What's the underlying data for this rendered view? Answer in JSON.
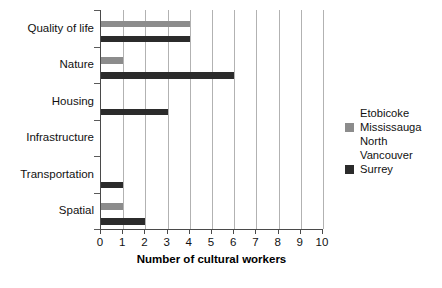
{
  "chart_data": {
    "type": "bar",
    "orientation": "horizontal",
    "title": "",
    "xlabel": "Number of cultural workers",
    "ylabel": "",
    "xlim": [
      0,
      10
    ],
    "xticks": [
      0,
      1,
      2,
      3,
      4,
      5,
      6,
      7,
      8,
      9,
      10
    ],
    "xtick_labels": [
      "0",
      "1",
      "2",
      "3",
      "4",
      "5",
      "6",
      "7",
      "8",
      "9",
      "10"
    ],
    "grid": "vertical",
    "legend_position": "right",
    "categories": [
      "Quality of life",
      "Nature",
      "Housing",
      "Infrastructure",
      "Transportation",
      "Spatial"
    ],
    "series": [
      {
        "name": "Etobicoke",
        "color": "#ffffff",
        "values": [
          0,
          0,
          0,
          0,
          0,
          0
        ]
      },
      {
        "name": "Mississauga",
        "color": "#8c8c8c",
        "values": [
          4,
          1,
          0,
          0,
          0,
          1
        ]
      },
      {
        "name": "North Vancouver",
        "color": "#ffffff",
        "values": [
          0,
          0,
          0,
          0,
          0,
          0
        ]
      },
      {
        "name": "Surrey",
        "color": "#2b2b2b",
        "values": [
          4,
          6,
          3,
          0,
          1,
          2
        ]
      }
    ]
  },
  "legend": {
    "entries": [
      {
        "label": "Etobicoke",
        "color": "#ffffff"
      },
      {
        "label": "Mississauga",
        "color": "#8c8c8c"
      },
      {
        "label": "North\nVancouver",
        "color": "#ffffff"
      },
      {
        "label": "Surrey",
        "color": "#2b2b2b"
      }
    ]
  },
  "axis": {
    "x_title": "Number of cultural workers"
  }
}
